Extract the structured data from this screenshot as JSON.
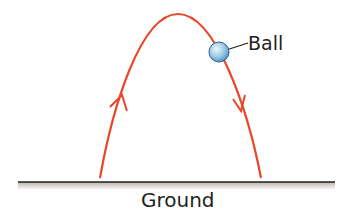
{
  "diagram": {
    "labels": {
      "ball": "Ball",
      "ground": "Ground"
    },
    "elements": {
      "trajectory": {
        "shape": "parabola",
        "color": "#e8472a",
        "start": [
          100,
          178
        ],
        "apex": [
          178,
          14
        ],
        "end": [
          261,
          178
        ]
      },
      "arrow_up": {
        "direction": "up",
        "position": [
          123,
          100
        ]
      },
      "arrow_down": {
        "direction": "down",
        "position": [
          242,
          108
        ]
      },
      "ball": {
        "center": [
          219,
          52
        ],
        "radius": 10,
        "color": "#8fbfe0"
      },
      "ground_line": {
        "y": 182,
        "x_start": 18,
        "x_end": 335,
        "color": "#231f20"
      }
    }
  }
}
